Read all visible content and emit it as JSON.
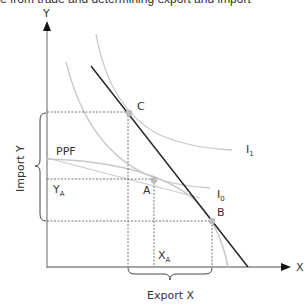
{
  "title": "e from trade and determining export and import",
  "axes": {
    "y_label": "Y",
    "x_label": "X"
  },
  "labels": {
    "ppf": "PPF",
    "point_c": "C",
    "point_a": "A",
    "point_b": "B",
    "i1": "I",
    "i1_sub": "1",
    "i0": "I",
    "i0_sub": "0",
    "ya": "Y",
    "ya_sub": "A",
    "xa": "X",
    "xa_sub": "A",
    "import_y": "Import Y",
    "export_x": "Export X"
  },
  "colors": {
    "axis": "#888888",
    "curve": "#c8c8c8",
    "trade_line": "#222222",
    "point": "#bdbdbd",
    "dashed": "#555555",
    "text": "#333333"
  }
}
